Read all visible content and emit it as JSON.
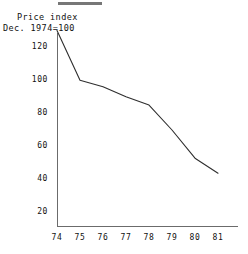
{
  "figure": {
    "top_rule_present": true,
    "line_color": "#2e2e2e",
    "axis_color": "#6b6b6b",
    "background": "#ffffff"
  },
  "axis_title": {
    "line1": "Price index",
    "line2": "Dec. 1974=100"
  },
  "chart_data": {
    "type": "line",
    "title": "Price index",
    "subtitle": "Dec. 1974=100",
    "xlabel": "",
    "ylabel": "Price index",
    "x": [
      "74",
      "75",
      "76",
      "77",
      "78",
      "79",
      "80",
      "81"
    ],
    "values": [
      130,
      100,
      96,
      90,
      85,
      70,
      53,
      44
    ],
    "series": [
      {
        "name": "Price index (Dec. 1974=100)",
        "values": [
          130,
          100,
          96,
          90,
          85,
          70,
          53,
          44
        ]
      }
    ],
    "xlim": [
      74,
      81
    ],
    "ylim": [
      10,
      133
    ],
    "ytick_labels": [
      "120",
      "100",
      "80",
      "60",
      "40",
      "20"
    ],
    "ytick_values": [
      120,
      100,
      80,
      60,
      40,
      20
    ],
    "xtick_labels": [
      "74",
      "75",
      "76",
      "77",
      "78",
      "79",
      "80",
      "81"
    ],
    "grid": false,
    "legend": "none",
    "markers": false
  }
}
